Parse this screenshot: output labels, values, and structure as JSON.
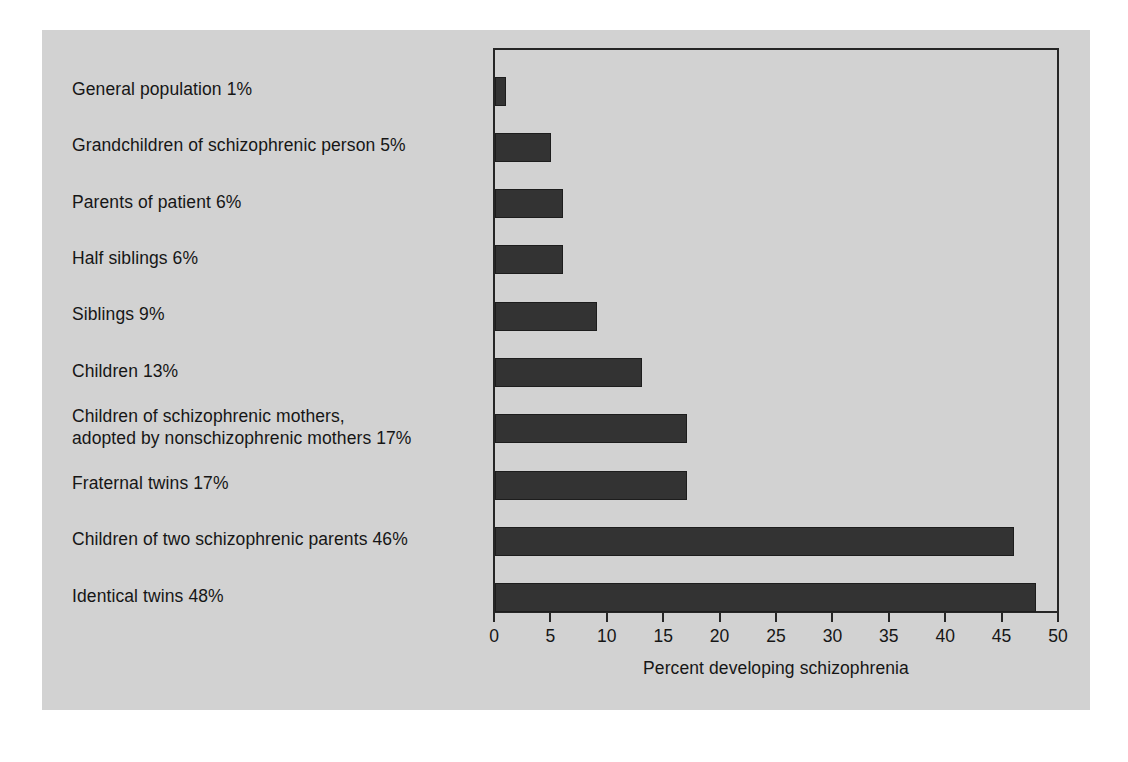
{
  "figure": {
    "background_color": "#d2d2d2",
    "page_color": "#ffffff",
    "bar_color": "#333333",
    "axis_color": "#262626",
    "text_color": "#161616"
  },
  "chart_data": {
    "type": "bar",
    "orientation": "horizontal",
    "title": "",
    "subtitle": "",
    "xlabel": "Percent developing schizophrenia",
    "ylabel": "",
    "xlim": [
      0,
      50
    ],
    "xticks": [
      0,
      5,
      10,
      15,
      20,
      25,
      30,
      35,
      40,
      45,
      50
    ],
    "xtick_labels": [
      "0",
      "5",
      "10",
      "15",
      "20",
      "25",
      "30",
      "35",
      "40",
      "45",
      "50"
    ],
    "grid": false,
    "legend": null,
    "legend_position": "none",
    "categories": [
      "General population",
      "Grandchildren of schizophrenic person",
      "Parents of patient",
      "Half siblings",
      "Siblings",
      "Children",
      "Children of schizophrenic mothers, adopted by nonschizophrenic mothers",
      "Fraternal twins",
      "Children of two schizophrenic parents",
      "Identical twins"
    ],
    "values": [
      1,
      5,
      6,
      6,
      9,
      13,
      17,
      17,
      46,
      48
    ],
    "value_labels": [
      "1%",
      "5%",
      "6%",
      "6%",
      "9%",
      "13%",
      "17%",
      "17%",
      "46%",
      "48%"
    ],
    "category_labels": [
      "General population 1%",
      "Grandchildren of schizophrenic person 5%",
      "Parents of patient 6%",
      "Half siblings 6%",
      "Siblings 9%",
      "Children 13%",
      "Children of schizophrenic mothers,\nadopted by nonschizophrenic mothers 17%",
      "Fraternal twins 17%",
      "Children of two schizophrenic parents 46%",
      "Identical twins 48%"
    ]
  }
}
